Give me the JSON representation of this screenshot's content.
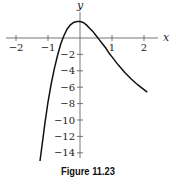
{
  "figure": {
    "caption": "Figure 11.23"
  },
  "chart_data": {
    "type": "line",
    "title": "",
    "xlabel": "x",
    "ylabel": "y",
    "xlim": [
      -2.3,
      2.5
    ],
    "ylim": [
      -15.5,
      3
    ],
    "grid": false,
    "legend": null,
    "x_ticks": [
      -2,
      -1,
      1,
      2
    ],
    "x_tick_labels": [
      "−2",
      "−1",
      "1",
      "2"
    ],
    "y_ticks": [
      -2,
      -4,
      -6,
      -8,
      -10,
      -12,
      -14
    ],
    "y_tick_labels": [
      "−2",
      "−4",
      "−6",
      "−8",
      "−10",
      "−12",
      "−14"
    ],
    "series": [
      {
        "name": "curve",
        "x": [
          -1.25,
          -1.1,
          -1.0,
          -0.9,
          -0.8,
          -0.7,
          -0.6,
          -0.5,
          -0.4,
          -0.3,
          -0.2,
          -0.1,
          0.0,
          0.1,
          0.2,
          0.3,
          0.4,
          0.5,
          0.6,
          0.7,
          0.8,
          0.9,
          1.0,
          1.2,
          1.4,
          1.6,
          1.8,
          2.0,
          2.1
        ],
        "y": [
          -15.0,
          -10.5,
          -7.8,
          -5.6,
          -3.7,
          -2.1,
          -0.7,
          0.3,
          1.1,
          1.6,
          1.9,
          2.0,
          2.0,
          1.9,
          1.6,
          1.2,
          0.8,
          0.3,
          -0.2,
          -0.7,
          -1.2,
          -1.8,
          -2.3,
          -3.3,
          -4.2,
          -5.0,
          -5.7,
          -6.3,
          -6.6
        ]
      }
    ],
    "annotations": []
  }
}
